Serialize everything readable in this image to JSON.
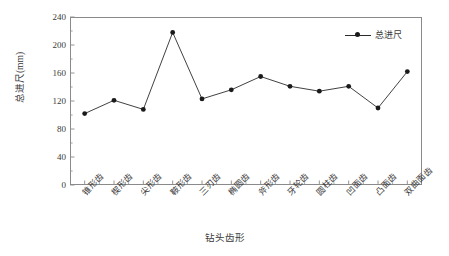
{
  "chart_data": {
    "type": "line",
    "title": "",
    "xlabel": "钻头齿形",
    "ylabel": "总进尺(mm)",
    "ylim": [
      0,
      240
    ],
    "ytick_labels": [
      "0",
      "40",
      "80",
      "120",
      "160",
      "200",
      "240"
    ],
    "ytick_values": [
      0,
      40,
      80,
      120,
      160,
      200,
      240
    ],
    "y_minor_per_major": 2,
    "grid": false,
    "legend_position": "top-right",
    "categories": [
      "锥形齿",
      "楔形齿",
      "尖形齿",
      "鞍形齿",
      "三刃齿",
      "椭圆齿",
      "斧形齿",
      "牙轮齿",
      "圆柱齿",
      "凹面齿",
      "凸面齿",
      "双曲面齿"
    ],
    "series": [
      {
        "name": "总进尺",
        "marker": "filled-circle",
        "color": "#1a1a1a",
        "values": [
          102,
          121,
          108,
          218,
          123,
          136,
          155,
          141,
          134,
          141,
          110,
          162
        ]
      }
    ]
  },
  "legend": {
    "entries": [
      {
        "label": "总进尺"
      }
    ]
  },
  "axes": {
    "y_axis_title": "总进尺(mm)",
    "x_axis_title": "钻头齿形"
  },
  "colors": {
    "line": "#2b2b2b",
    "marker": "#1a1a1a",
    "frame": "#8a8a8a",
    "text": "#3a3a3a",
    "background": "#ffffff"
  }
}
